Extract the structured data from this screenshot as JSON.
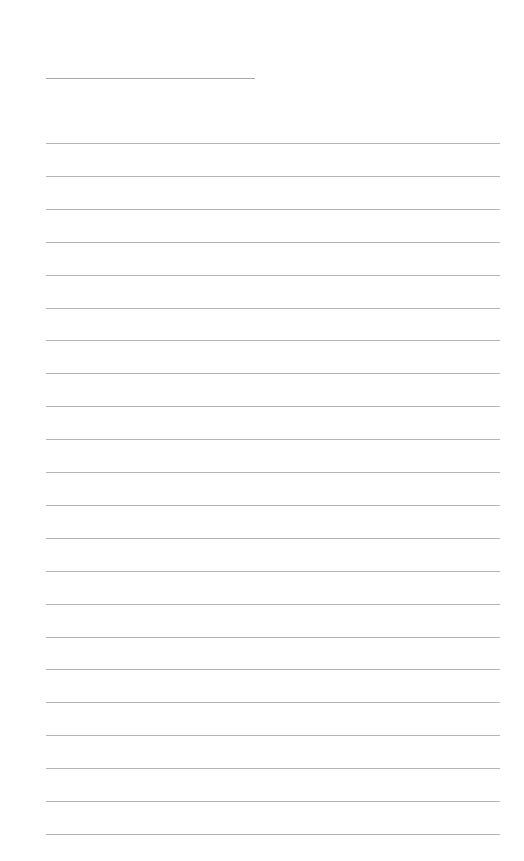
{
  "page": {
    "type": "blank lined paper",
    "title_line": {
      "x": 46,
      "y": 78,
      "width": 209
    },
    "ruled_lines": {
      "count": 22,
      "x": 46,
      "width": 454,
      "first_y": 143,
      "spacing": 32.9
    },
    "colors": {
      "background": "#ffffff",
      "rule": "#b4b4b4"
    }
  }
}
